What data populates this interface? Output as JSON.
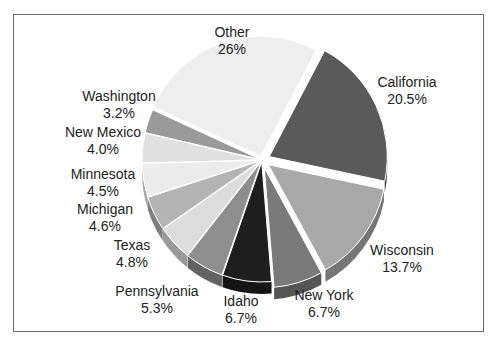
{
  "chart_data": {
    "type": "pie",
    "title": "",
    "exploded": true,
    "three_d": true,
    "categories": [
      "California",
      "Wisconsin",
      "New York",
      "Idaho",
      "Pennsylvania",
      "Texas",
      "Michigan",
      "Minnesota",
      "New Mexico",
      "Washington",
      "Other"
    ],
    "values": [
      20.5,
      13.7,
      6.7,
      6.7,
      5.3,
      4.8,
      4.6,
      4.5,
      4.0,
      3.2,
      26
    ],
    "value_labels": [
      "20.5%",
      "13.7%",
      "6.7%",
      "6.7%",
      "5.3%",
      "4.8%",
      "4.6%",
      "4.5%",
      "4.0%",
      "3.2%",
      "26%"
    ],
    "colors": [
      "#5a5a5a",
      "#a8a8a8",
      "#7a7a7a",
      "#1e1e1e",
      "#8e8e8e",
      "#dcdcdc",
      "#b4b4b4",
      "#ececec",
      "#e0e0e0",
      "#9a9a9a",
      "#eeeeee"
    ],
    "legend": "none",
    "labels_position": "outside"
  },
  "labels": {
    "other": {
      "name": "Other",
      "value": "26%"
    },
    "california": {
      "name": "California",
      "value": "20.5%"
    },
    "wisconsin": {
      "name": "Wisconsin",
      "value": "13.7%"
    },
    "new_york": {
      "name": "New York",
      "value": "6.7%"
    },
    "idaho": {
      "name": "Idaho",
      "value": "6.7%"
    },
    "pennsylvania": {
      "name": "Pennsylvania",
      "value": "5.3%"
    },
    "texas": {
      "name": "Texas",
      "value": "4.8%"
    },
    "michigan": {
      "name": "Michigan",
      "value": "4.6%"
    },
    "minnesota": {
      "name": "Minnesota",
      "value": "4.5%"
    },
    "new_mexico": {
      "name": "New Mexico",
      "value": "4.0%"
    },
    "washington": {
      "name": "Washington",
      "value": "3.2%"
    }
  }
}
